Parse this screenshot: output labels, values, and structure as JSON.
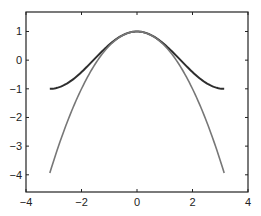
{
  "chart_data": {
    "type": "line",
    "title": "",
    "xlabel": "",
    "ylabel": "",
    "xlim": [
      -4,
      4
    ],
    "ylim": [
      -4.6,
      1.68
    ],
    "grid": false,
    "legend": null,
    "x_ticks": [
      -4,
      -2,
      0,
      2,
      4
    ],
    "x_tick_labels": [
      "−4",
      "−2",
      "0",
      "2",
      "4"
    ],
    "y_ticks": [
      1,
      0,
      -1,
      -2,
      -3,
      -4
    ],
    "y_tick_labels": [
      "1",
      "0",
      "−1",
      "−2",
      "−3",
      "−4"
    ],
    "x_range": [
      -3.1416,
      3.1416
    ],
    "series": [
      {
        "name": "cos(x)",
        "color": "#2e2e2e",
        "x": [
          -3.1416,
          -2.618,
          -2.0944,
          -1.5708,
          -1.0472,
          -0.5236,
          0,
          0.5236,
          1.0472,
          1.5708,
          2.0944,
          2.618,
          3.1416
        ],
        "values": [
          -1.0,
          -0.866,
          -0.5,
          0.0,
          0.5,
          0.866,
          1.0,
          0.866,
          0.5,
          0.0,
          -0.5,
          -0.866,
          -1.0
        ]
      },
      {
        "name": "1 - x^2/2",
        "color": "#777777",
        "x": [
          -3.1416,
          -2.618,
          -2.0944,
          -1.5708,
          -1.0472,
          -0.5236,
          0,
          0.5236,
          1.0472,
          1.5708,
          2.0944,
          2.618,
          3.1416
        ],
        "values": [
          -3.935,
          -2.427,
          -1.193,
          -0.234,
          0.452,
          0.863,
          1.0,
          0.863,
          0.452,
          -0.234,
          -1.193,
          -2.427,
          -3.935
        ]
      }
    ]
  },
  "plot": {
    "left": 26,
    "top": 12,
    "right": 248,
    "bottom": 192,
    "axis_color": "#222222",
    "background": "#ffffff"
  }
}
